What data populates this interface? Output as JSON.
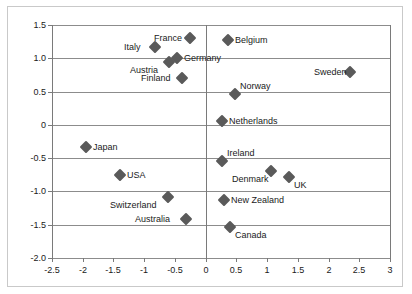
{
  "chart_data": {
    "type": "scatter",
    "title": "",
    "xlabel": "",
    "ylabel": "",
    "xlim": [
      -2.5,
      3
    ],
    "ylim": [
      -2.0,
      1.5
    ],
    "grid": true,
    "legend": "none",
    "xticks": [
      "-2.5",
      "-2",
      "-1.5",
      "-1",
      "-0.5",
      "0",
      "0.5",
      "1",
      "1.5",
      "2",
      "2.5",
      "3"
    ],
    "xtick_values": [
      -2.5,
      -2,
      -1.5,
      -1,
      -0.5,
      0,
      0.5,
      1,
      1.5,
      2,
      2.5,
      3
    ],
    "yticks": [
      "1.5",
      "1.0",
      "0.5",
      "0",
      "-0.5",
      "-1.0",
      "-1.5",
      "-2.0"
    ],
    "ytick_values": [
      1.5,
      1.0,
      0.5,
      0,
      -0.5,
      -1.0,
      -1.5,
      -2.0
    ],
    "marker_color": "#5a5a5a",
    "marker_shape": "diamond",
    "points": [
      {
        "label": "France",
        "x": -0.25,
        "y": 1.3,
        "label_pos": "left"
      },
      {
        "label": "Belgium",
        "x": 0.37,
        "y": 1.28,
        "label_pos": "right"
      },
      {
        "label": "Italy",
        "x": -0.82,
        "y": 1.17,
        "label_pos": "left"
      },
      {
        "label": "Germany",
        "x": -0.47,
        "y": 1.01,
        "label_pos": "right"
      },
      {
        "label": "Austria",
        "x": -0.6,
        "y": 0.95,
        "label_pos": "below-left"
      },
      {
        "label": "Sweden",
        "x": 2.35,
        "y": 0.79,
        "label_pos": "left"
      },
      {
        "label": "Finland",
        "x": -0.38,
        "y": 0.71,
        "label_pos": "left"
      },
      {
        "label": "Norway",
        "x": 0.47,
        "y": 0.46,
        "label_pos": "above-right"
      },
      {
        "label": "Netherlands",
        "x": 0.27,
        "y": 0.06,
        "label_pos": "right"
      },
      {
        "label": "Japan",
        "x": -1.94,
        "y": -0.34,
        "label_pos": "right"
      },
      {
        "label": "Ireland",
        "x": 0.27,
        "y": -0.54,
        "label_pos": "above-right"
      },
      {
        "label": "Denmark",
        "x": 1.06,
        "y": -0.69,
        "label_pos": "below-left"
      },
      {
        "label": "USA",
        "x": -1.39,
        "y": -0.76,
        "label_pos": "right"
      },
      {
        "label": "UK",
        "x": 1.35,
        "y": -0.79,
        "label_pos": "below-right"
      },
      {
        "label": "Switzerland",
        "x": -0.61,
        "y": -1.09,
        "label_pos": "below-left"
      },
      {
        "label": "New Zealand",
        "x": 0.3,
        "y": -1.13,
        "label_pos": "right"
      },
      {
        "label": "Australia",
        "x": -0.32,
        "y": -1.41,
        "label_pos": "left"
      },
      {
        "label": "Canada",
        "x": 0.39,
        "y": -1.53,
        "label_pos": "below-right"
      }
    ]
  }
}
